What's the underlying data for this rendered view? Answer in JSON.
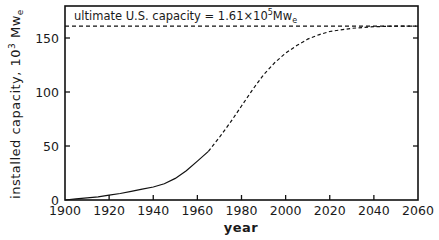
{
  "chart_data": {
    "type": "line",
    "title": "",
    "xlabel": "year",
    "ylabel": "installed capacity, 10^3 Mw_e",
    "ylabel_parts": {
      "main": "installed capacity, 10",
      "sup": "3",
      "unit": " Mw",
      "sub": "e"
    },
    "xlim": [
      1900,
      2060
    ],
    "ylim": [
      0,
      175
    ],
    "x_ticks": [
      1900,
      1920,
      1940,
      1960,
      1980,
      2000,
      2020,
      2040,
      2060
    ],
    "x_tick_labels": [
      "1900",
      "1920",
      "1940",
      "1960",
      "1980",
      "2000",
      "2020",
      "2040",
      "2060"
    ],
    "y_ticks": [
      0,
      50,
      100,
      150
    ],
    "y_tick_labels": [
      "0",
      "50",
      "100",
      "150"
    ],
    "grid": false,
    "legend": null,
    "annotations": [
      {
        "text_main": "ultimate U.S. capacity = 1.61×10",
        "sup": "5",
        "unit": "Mw",
        "sub": "e",
        "y": 161,
        "style": "dashed horizontal line"
      }
    ],
    "series": [
      {
        "name": "historical (actual)",
        "style": "solid",
        "x": [
          1900,
          1905,
          1910,
          1915,
          1920,
          1925,
          1930,
          1935,
          1940,
          1945,
          1950,
          1955,
          1960,
          1965
        ],
        "values": [
          0,
          1,
          2,
          3,
          4.5,
          6,
          8,
          10,
          12,
          15,
          20,
          27,
          36,
          45
        ]
      },
      {
        "name": "projected",
        "style": "dashed",
        "x": [
          1965,
          1970,
          1975,
          1980,
          1985,
          1990,
          1995,
          2000,
          2005,
          2010,
          2015,
          2020,
          2030,
          2040,
          2050,
          2060
        ],
        "values": [
          45,
          58,
          72,
          87,
          102,
          116,
          127,
          136,
          143,
          149,
          153,
          156,
          159,
          160.5,
          161,
          161
        ]
      }
    ],
    "asymptote": {
      "name": "ultimate U.S. capacity",
      "value": 161,
      "style": "dashed"
    }
  }
}
